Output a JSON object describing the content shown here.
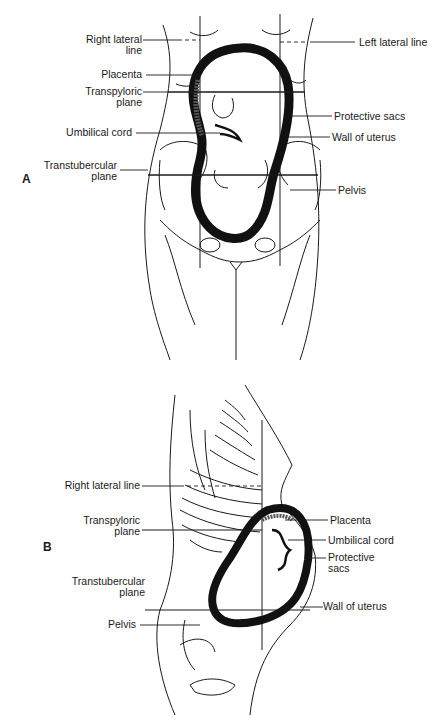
{
  "figure_a": {
    "panel_letter": "A",
    "view": "anterior",
    "labels_left": [
      {
        "line1": "Right lateral",
        "line2": "line"
      },
      {
        "line1": "Placenta",
        "line2": ""
      },
      {
        "line1": "Transpyloric",
        "line2": "plane"
      },
      {
        "line1": "Umbilical cord",
        "line2": ""
      },
      {
        "line1": "Transtubercular",
        "line2": "plane"
      }
    ],
    "labels_right": [
      {
        "line1": "Left lateral line",
        "line2": ""
      },
      {
        "line1": "Protective sacs",
        "line2": ""
      },
      {
        "line1": "Wall of uterus",
        "line2": ""
      },
      {
        "line1": "Pelvis",
        "line2": ""
      }
    ]
  },
  "figure_b": {
    "panel_letter": "B",
    "view": "lateral",
    "labels_left": [
      {
        "line1": "Right lateral line",
        "line2": ""
      },
      {
        "line1": "Transpyloric",
        "line2": "plane"
      },
      {
        "line1": "Transtubercular",
        "line2": "plane"
      },
      {
        "line1": "Pelvis",
        "line2": ""
      }
    ],
    "labels_right": [
      {
        "line1": "Placenta",
        "line2": ""
      },
      {
        "line1": "Umbilical cord",
        "line2": ""
      },
      {
        "line1": "Protective",
        "line2": "sacs"
      },
      {
        "line1": "Wall of uterus",
        "line2": ""
      }
    ]
  },
  "colors": {
    "ink": "#1a1a1a",
    "background": "#ffffff"
  }
}
